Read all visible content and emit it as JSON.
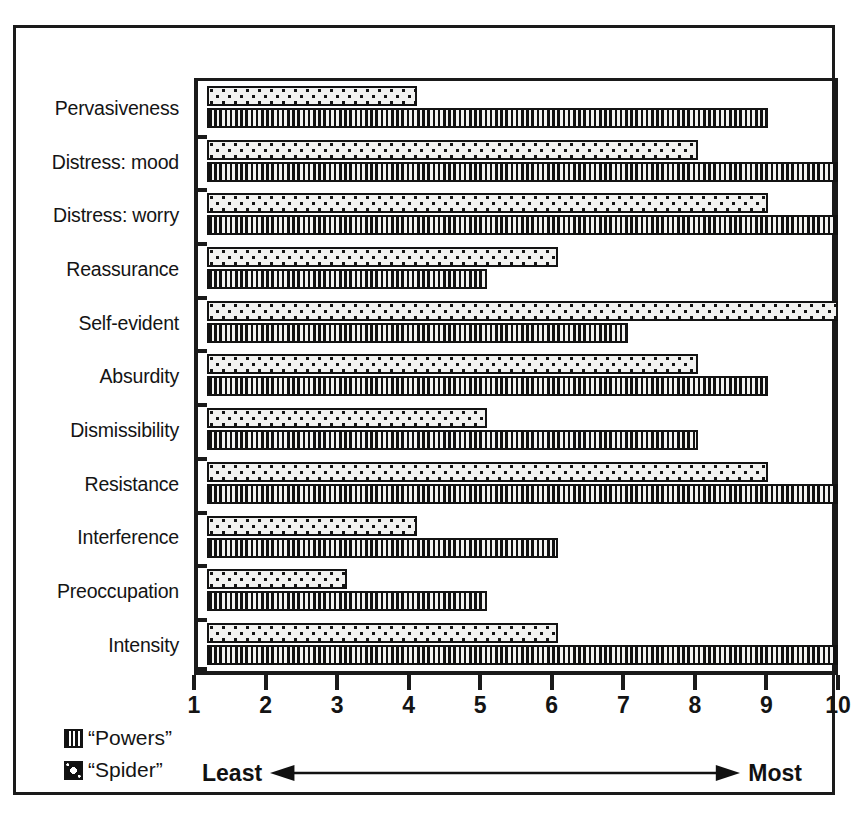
{
  "chart_data": {
    "type": "bar",
    "orientation": "horizontal",
    "title": "",
    "xlabel": "",
    "ylabel": "",
    "xlim": [
      1,
      10
    ],
    "grid": false,
    "legend_position": "bottom-left",
    "xticks": [
      "1",
      "2",
      "3",
      "4",
      "5",
      "6",
      "7",
      "8",
      "9",
      "10"
    ],
    "categories": [
      "Pervasiveness",
      "Distress: mood",
      "Distress: worry",
      "Reassurance",
      "Self-evident",
      "Absurdity",
      "Dismissibility",
      "Resistance",
      "Interference",
      "Preoccupation",
      "Intensity"
    ],
    "series": [
      {
        "name": "“Spider”",
        "pattern": "dotted",
        "values": [
          4,
          8,
          9,
          6,
          10,
          8,
          5,
          9,
          4,
          3,
          6
        ]
      },
      {
        "name": "“Powers”",
        "pattern": "vertical-stripes",
        "values": [
          9,
          10,
          10,
          5,
          7,
          9,
          8,
          10,
          6,
          5,
          10
        ]
      }
    ],
    "annotations": {
      "scale_left": "Least",
      "scale_right": "Most",
      "arrow": "double-headed"
    }
  },
  "legend": {
    "items": [
      {
        "label": "“Powers”",
        "swatch": "vertical-stripes-swatch"
      },
      {
        "label": "“Spider”",
        "swatch": "dotted-swatch"
      }
    ]
  },
  "colors": {
    "ink": "#131313",
    "paper": "#ffffff",
    "bar_fill": "#f2f2f0"
  }
}
